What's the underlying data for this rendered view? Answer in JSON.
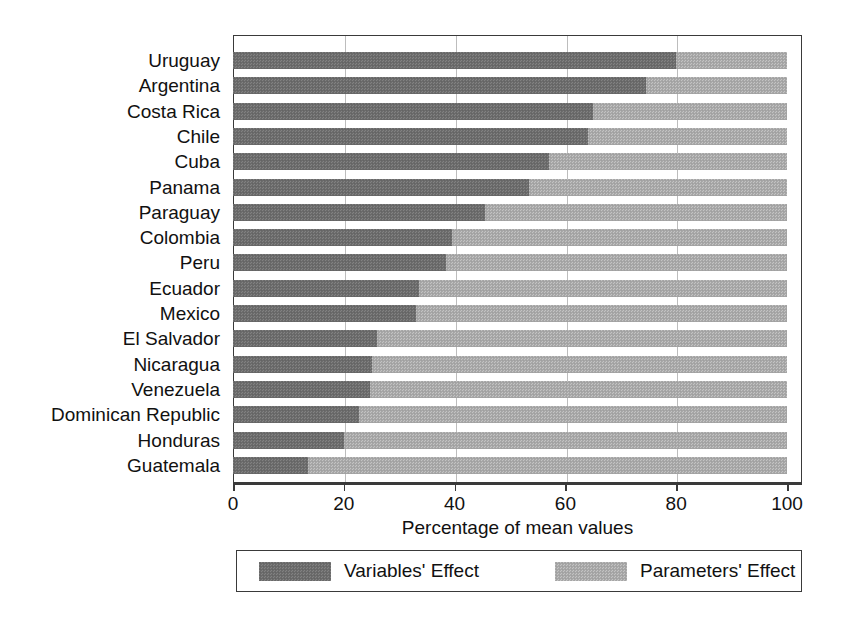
{
  "chart_data": {
    "type": "bar",
    "orientation": "horizontal",
    "stacked": true,
    "stack_total": 100,
    "title": "",
    "xlabel": "Percentage of mean values",
    "ylabel": "",
    "xlim": [
      0,
      100
    ],
    "xticks": [
      0,
      20,
      40,
      60,
      80,
      100
    ],
    "xticklabels": [
      "0",
      "20",
      "40",
      "60",
      "80",
      "100"
    ],
    "grid": true,
    "grid_axis": "x",
    "legend_position": "bottom",
    "categories": [
      "Uruguay",
      "Argentina",
      "Costa Rica",
      "Chile",
      "Cuba",
      "Panama",
      "Paraguay",
      "Colombia",
      "Peru",
      "Ecuador",
      "Mexico",
      "El Salvador",
      "Nicaragua",
      "Venezuela",
      "Dominican Republic",
      "Honduras",
      "Guatemala"
    ],
    "series": [
      {
        "name": "Variables' Effect",
        "color": "#6d6d6d",
        "values": [
          80.0,
          74.5,
          65.0,
          64.0,
          57.0,
          53.5,
          45.5,
          39.5,
          38.5,
          33.5,
          33.0,
          26.0,
          25.0,
          24.8,
          22.8,
          20.0,
          13.5
        ]
      },
      {
        "name": "Parameters' Effect",
        "color": "#a9a9a9",
        "values": [
          20.0,
          25.5,
          35.0,
          36.0,
          43.0,
          46.5,
          54.5,
          60.5,
          61.5,
          66.5,
          67.0,
          74.0,
          75.0,
          75.2,
          77.2,
          80.0,
          86.5
        ]
      }
    ]
  },
  "legend": {
    "items": [
      {
        "label": "Variables' Effect",
        "color": "#6d6d6d"
      },
      {
        "label": "Parameters' Effect",
        "color": "#a9a9a9"
      }
    ]
  },
  "axis": {
    "x_title": "Percentage of mean values",
    "x_tick_labels": [
      "0",
      "20",
      "40",
      "60",
      "80",
      "100"
    ]
  }
}
